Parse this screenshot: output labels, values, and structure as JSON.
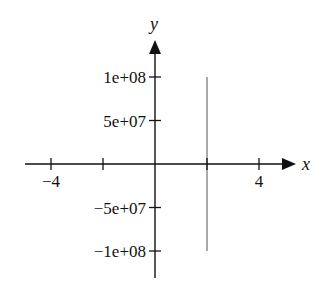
{
  "chart_data": {
    "type": "line",
    "title": "",
    "xlabel": "x",
    "ylabel": "y",
    "xlim": [
      -5,
      5.3
    ],
    "ylim": [
      -130000000.0,
      150000000.0
    ],
    "grid": false,
    "legend": null,
    "x_ticks": [
      -4,
      -2,
      0,
      2,
      4
    ],
    "x_tick_labels": [
      {
        "value": -4,
        "label": "−4"
      },
      {
        "value": 4,
        "label": "4"
      }
    ],
    "y_ticks": [
      100000000.0,
      50000000.0,
      -50000000.0,
      -100000000.0
    ],
    "y_tick_labels": [
      {
        "value": 100000000.0,
        "label": "1e+08"
      },
      {
        "value": 50000000.0,
        "label": "5e+07"
      },
      {
        "value": -50000000.0,
        "label": "−5e+07"
      },
      {
        "value": -100000000.0,
        "label": "−1e+08"
      }
    ],
    "series": [
      {
        "name": "vertical line",
        "color": "#a9a9a9",
        "x": [
          2,
          2
        ],
        "y": [
          -100000000.0,
          100000000.0
        ]
      }
    ]
  },
  "axes": {
    "x_label": "x",
    "y_label": "y",
    "axis_color": "#111111",
    "series_color": "#a9a9a9"
  }
}
